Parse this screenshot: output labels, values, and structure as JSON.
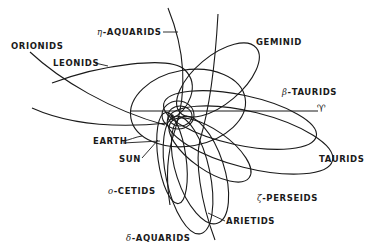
{
  "diagram": {
    "vernal_equinox_symbol": "♈",
    "labels": {
      "eta_aquarids": {
        "greek": "η",
        "text": "-AQUARIDS"
      },
      "orionids": "ORIONIDS",
      "leonids": "LEONIDS",
      "geminid": "GEMINID",
      "beta_taurids": {
        "greek": "β",
        "text": "-TAURIDS"
      },
      "taurids": "TAURIDS",
      "earth": "EARTH",
      "sun": "SUN",
      "omicron_cetids": {
        "greek": "ο",
        "text": "-CETIDS"
      },
      "zeta_perseids": {
        "greek": "ζ",
        "text": "-PERSEIDS"
      },
      "arietids": "ARIETIDS",
      "delta_aquarids": {
        "greek": "δ",
        "text": "-AQUARIDS"
      }
    },
    "nodes": [
      "Sun",
      "Earth orbit",
      "Vernal equinox direction (♈)"
    ],
    "edges": [
      "η-Aquarids orbit",
      "Orionids orbit",
      "Leonids orbit",
      "Geminid orbit",
      "β-Taurids orbit",
      "Taurids orbit",
      "ο-Cetids orbit",
      "ζ-Perseids orbit",
      "Arietids orbit",
      "δ-Aquarids orbit"
    ],
    "colors": {
      "line": "#1a1a1a",
      "background": "#ffffff"
    }
  }
}
